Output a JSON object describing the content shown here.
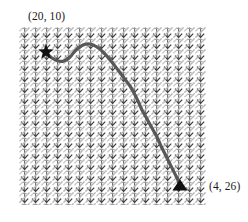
{
  "figure": {
    "title": "",
    "background_color": "#ffffff"
  },
  "chart_data": {
    "type": "scatter",
    "title": "",
    "xlabel": "",
    "ylabel": "",
    "grid": true,
    "legend_position": "none",
    "xlim": [
      0,
      30
    ],
    "ylim": [
      0,
      30
    ],
    "field": {
      "glyph": "arrow",
      "columns": 17,
      "rows": 16,
      "arrow_color": "#8a8a8a",
      "arrow_dark_color": "#4f4f4f",
      "direction_degrees": 250
    },
    "markers": [
      {
        "name": "start",
        "shape": "star",
        "label": "(20, 10)",
        "color": "#111111",
        "x": 20,
        "y": 10,
        "px": 46,
        "py": 52
      },
      {
        "name": "goal",
        "shape": "triangle",
        "label": "(4, 26)",
        "color": "#111111",
        "x": 4,
        "y": 26,
        "px": 180,
        "py": 186
      }
    ],
    "series": [
      {
        "name": "trajectory",
        "color": "#585858",
        "line_width": 3.2,
        "points_px": [
          [
            46,
            53
          ],
          [
            52,
            58
          ],
          [
            58,
            61
          ],
          [
            64,
            61
          ],
          [
            70,
            57
          ],
          [
            76,
            50
          ],
          [
            83,
            45
          ],
          [
            90,
            44
          ],
          [
            97,
            47
          ],
          [
            104,
            53
          ],
          [
            111,
            61
          ],
          [
            118,
            70
          ],
          [
            124,
            78
          ],
          [
            130,
            86
          ],
          [
            134,
            93
          ],
          [
            138,
            101
          ],
          [
            142,
            110
          ],
          [
            147,
            119
          ],
          [
            152,
            128
          ],
          [
            157,
            137
          ],
          [
            161,
            146
          ],
          [
            165,
            154
          ],
          [
            169,
            162
          ],
          [
            173,
            170
          ],
          [
            177,
            178
          ],
          [
            180,
            185
          ]
        ]
      }
    ]
  },
  "labels": {
    "start_point": "(20, 10)",
    "end_point": "(4, 26)"
  }
}
